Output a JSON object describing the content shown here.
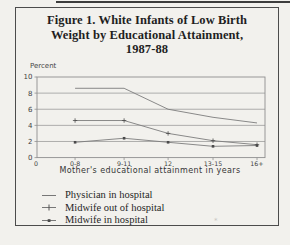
{
  "page": {
    "title_lines": [
      "Figure 1. White Infants of Low Birth",
      "Weight by Educational Attainment,",
      "1987-88"
    ]
  },
  "chart_data": {
    "type": "line",
    "title": "Figure 1. White Infants of Low Birth Weight by Educational Attainment, 1987-88",
    "ylabel": "Percent",
    "xlabel": "Mother's educational attainment in years",
    "categories": [
      "0-8",
      "9-11",
      "12",
      "13-15",
      "16+"
    ],
    "x_origin_label": "0",
    "ylim": [
      0,
      10
    ],
    "yticks": [
      0,
      2,
      4,
      6,
      8,
      10
    ],
    "grid": true,
    "legend_position": "bottom-left",
    "series": [
      {
        "name": "Physician in hospital",
        "marker": "none",
        "values": [
          8.6,
          8.6,
          6.0,
          5.0,
          4.3
        ]
      },
      {
        "name": "Midwife out of hospital",
        "marker": "plus",
        "values": [
          4.6,
          4.6,
          3.0,
          2.1,
          1.6
        ]
      },
      {
        "name": "Midwife in hospital",
        "marker": "square",
        "values": [
          1.9,
          2.4,
          1.9,
          1.4,
          1.5
        ]
      }
    ],
    "colors": {
      "line": "#7d7d7d",
      "grid": "#8f8f8f",
      "marker": "#4a4a4a",
      "tick_text": "#3f3f3f",
      "paper": "#f2f1ed",
      "border": "#4c4c4c"
    }
  }
}
